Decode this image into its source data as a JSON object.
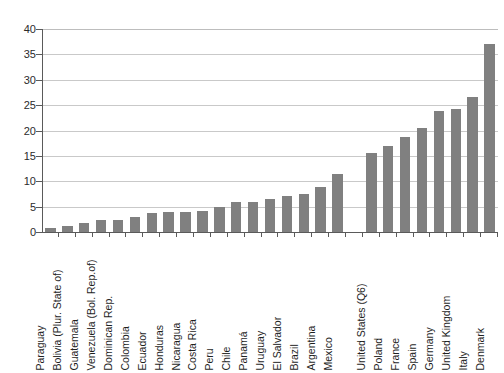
{
  "chart_data": {
    "type": "bar",
    "title": "",
    "subtitle": "",
    "xlabel": "",
    "ylabel": "",
    "ylim": [
      0,
      40
    ],
    "ytick_step": 5,
    "yticks": [
      0,
      5,
      10,
      15,
      20,
      25,
      30,
      35,
      40
    ],
    "grid": true,
    "legend": false,
    "legend_position": "none",
    "orientation": "vertical",
    "bar_color": "#808080",
    "gridline_color": "#c9c9c9",
    "axis_color": "#5a5a5a",
    "categories": [
      "Paraguay",
      "Bolivia (Plur. State of)",
      "Guatemala",
      "Venezuela (Bol. Rep.of)",
      "Dominican Rep.",
      "Colombia",
      "Ecuador",
      "Honduras",
      "Nicaragua",
      "Costa Rica",
      "Peru",
      "Chile",
      "Panamá",
      "Uruguay",
      "El Salvador",
      "Brazil",
      "Argentina",
      "Mexico",
      "",
      "United States (Q6)",
      "Poland",
      "France",
      "Spain",
      "Germany",
      "United Kingdom",
      "Italy",
      "Denmark"
    ],
    "values": [
      0.8,
      1.2,
      1.7,
      2.3,
      2.4,
      3.0,
      3.8,
      4.0,
      4.0,
      4.2,
      5.0,
      5.9,
      5.9,
      6.5,
      7.0,
      7.4,
      8.8,
      11.5,
      null,
      15.5,
      17.0,
      18.8,
      20.4,
      23.8,
      24.2,
      26.7,
      37.0
    ]
  }
}
